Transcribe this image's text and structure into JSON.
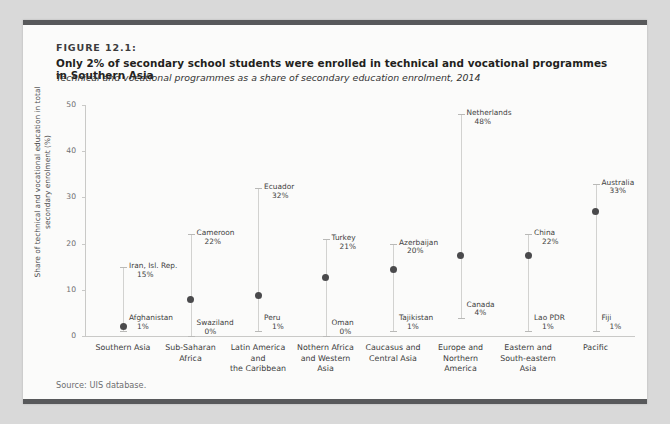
{
  "figure": {
    "label": "FIGURE 12.1:",
    "title": "Only 2% of secondary school students were enrolled in technical and vocational programmes in Southern Asia",
    "subtitle": "Technical and vocational programmes as a share of secondary education enrolment, 2014",
    "source": "Source: UIS database."
  },
  "colors": {
    "rule": "#58595b",
    "panel": "#fbfbfa",
    "page": "#d9d9d9",
    "dot": "#4a4a4c",
    "range": "#d2d2d0",
    "axis": "#c9c9c7"
  },
  "chart_data": {
    "type": "scatter",
    "title": "Only 2% of secondary school students were enrolled in technical and vocational programmes in Southern Asia",
    "subtitle": "Technical and vocational programmes as a share of secondary education enrolment, 2014",
    "xlabel": "",
    "ylabel": "Share of technical and vocational education in total secondary enrolment (%)",
    "ylim": [
      0,
      50
    ],
    "yticks": [
      0,
      10,
      20,
      30,
      40,
      50
    ],
    "ytick_labels": [
      "0",
      "10",
      "20",
      "30",
      "40",
      "50"
    ],
    "grid": false,
    "legend": "none",
    "categories": [
      "Southern Asia",
      "Sub-Saharan Africa",
      "Latin America and the Caribbean",
      "Nothern Africa and Western Asia",
      "Caucasus and Central Asia",
      "Europe and Northern America",
      "Eastern and South-eastern Asia",
      "Pacific"
    ],
    "category_label_lines": [
      [
        "Southern Asia"
      ],
      [
        "Sub-Saharan",
        "Africa"
      ],
      [
        "Latin America and",
        "the Caribbean"
      ],
      [
        "Nothern Africa",
        "and Western Asia"
      ],
      [
        "Caucasus and",
        "Central Asia"
      ],
      [
        "Europe and",
        "Northern America"
      ],
      [
        "Eastern and",
        "South-eastern",
        "Asia"
      ],
      [
        "Pacific"
      ]
    ],
    "series": [
      {
        "name": "Regional maximum",
        "values": [
          15,
          22,
          32,
          21,
          20,
          48,
          22,
          33
        ],
        "labels": [
          "Iran, Isl. Rep.",
          "Cameroon",
          "Ecuador",
          "Turkey",
          "Azerbaijan",
          "Netherlands",
          "China",
          "Australia"
        ],
        "value_labels": [
          "15%",
          "22%",
          "32%",
          "21%",
          "20%",
          "48%",
          "22%",
          "33%"
        ]
      },
      {
        "name": "Regional minimum",
        "values": [
          1,
          0,
          1,
          0,
          1,
          4,
          1,
          1
        ],
        "labels": [
          "Afghanistan",
          "Swaziland",
          "Peru",
          "Oman",
          "Tajikistan",
          "Canada",
          "Lao PDR",
          "Fiji"
        ],
        "value_labels": [
          "1%",
          "0%",
          "1%",
          "0%",
          "1%",
          "4%",
          "1%",
          "1%"
        ]
      },
      {
        "name": "Regional average",
        "values": [
          2,
          7.8,
          8.7,
          12.7,
          14.5,
          17.5,
          17.5,
          27
        ],
        "labels": [
          "",
          "",
          "",
          "",
          "",
          "",
          "",
          ""
        ],
        "value_labels": [
          "",
          "",
          "",
          "",
          "",
          "",
          "",
          ""
        ]
      }
    ]
  }
}
